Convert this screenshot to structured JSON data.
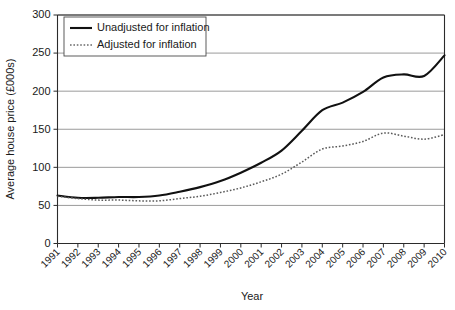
{
  "chart_data": {
    "type": "line",
    "title": "",
    "xlabel": "Year",
    "ylabel": "Average house price (£000s)",
    "categories": [
      "1991",
      "1992",
      "1993",
      "1994",
      "1995",
      "1996",
      "1997",
      "1998",
      "1999",
      "2000",
      "2001",
      "2002",
      "2003",
      "2004",
      "2005",
      "2006",
      "2007",
      "2008",
      "2009",
      "2010"
    ],
    "xlim": [
      1991,
      2010
    ],
    "ylim": [
      0,
      300
    ],
    "yticks": [
      0,
      50,
      100,
      150,
      200,
      250,
      300
    ],
    "ytick_labels": [
      "0",
      "50",
      "100",
      "150",
      "200",
      "250",
      "300"
    ],
    "grid": "horizontal",
    "legend_position": "top-left",
    "series": [
      {
        "name": "Unadjusted for inflation",
        "style": "solid",
        "color": "#111111",
        "values": [
          63,
          60,
          60,
          61,
          61,
          63,
          68,
          74,
          82,
          93,
          106,
          122,
          148,
          175,
          185,
          199,
          218,
          222,
          220,
          247
        ]
      },
      {
        "name": "Adjusted for inflation",
        "style": "dotted",
        "color": "#5a5a5a",
        "values": [
          62,
          59,
          57,
          57,
          56,
          56,
          59,
          62,
          67,
          73,
          81,
          91,
          107,
          124,
          128,
          134,
          145,
          141,
          137,
          143
        ]
      }
    ]
  },
  "legend": {
    "items": [
      {
        "label": "Unadjusted for inflation",
        "style": "solid"
      },
      {
        "label": "Adjusted for inflation",
        "style": "dotted"
      }
    ]
  }
}
